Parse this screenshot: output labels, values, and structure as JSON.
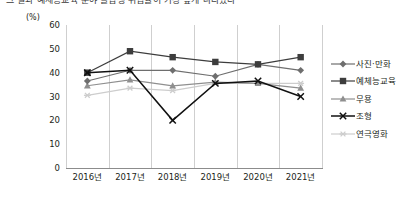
{
  "top_strip": {
    "cut_heading": "그 결과 예체능교육 분야 졸업생 취업률이 가장 높게 나타났다"
  },
  "chart_data": {
    "type": "line",
    "title": "",
    "subtitle": "",
    "xlabel": "",
    "ylabel": "",
    "unit_label": "(%)",
    "ylim": [
      0,
      60
    ],
    "ytick_step": 10,
    "yticks": [
      "0",
      "10",
      "20",
      "30",
      "40",
      "50",
      "60"
    ],
    "grid": "vertical",
    "legend_position": "right",
    "categories": [
      "2016년",
      "2017년",
      "2018년",
      "2019년",
      "2020년",
      "2021년"
    ],
    "series": [
      {
        "name": "사진·만화",
        "color": "#6e6e6e",
        "marker": "diamond",
        "values": [
          36.5,
          41,
          41,
          38.5,
          43.5,
          41
        ]
      },
      {
        "name": "예체능교육",
        "color": "#3d3d3d",
        "marker": "square",
        "values": [
          40,
          49,
          46.5,
          44.5,
          43.5,
          46.5
        ]
      },
      {
        "name": "무용",
        "color": "#8f8f8f",
        "marker": "triangle",
        "values": [
          34.5,
          37,
          34.5,
          36,
          35.5,
          33.5
        ]
      },
      {
        "name": "조형",
        "color": "#111111",
        "marker": "cross",
        "values": [
          40,
          41,
          20,
          35.5,
          36.5,
          30
        ]
      },
      {
        "name": "연극영화",
        "color": "#cdcdcd",
        "marker": "asterisk",
        "values": [
          30.5,
          33.5,
          32.5,
          35.5,
          35.5,
          35.5
        ]
      }
    ]
  }
}
